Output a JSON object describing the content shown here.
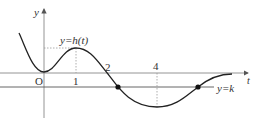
{
  "diagram": {
    "axes": {
      "x_label": "t",
      "y_label": "y",
      "origin_label": "O"
    },
    "curve_label": "y=h(t)",
    "line_label": "y=k",
    "tick_labels": [
      "1",
      "2",
      "4"
    ],
    "colors": {
      "axis": "#555555",
      "curve": "#222222",
      "dashed": "#888888",
      "point": "#111111"
    }
  }
}
